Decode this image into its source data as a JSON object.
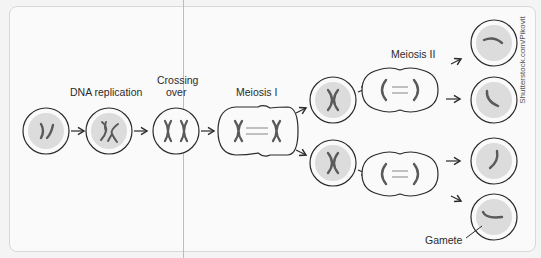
{
  "diagram": {
    "title": "Meiosis",
    "labels": {
      "dna_replication": "DNA replication",
      "crossing_over_line1": "Crossing",
      "crossing_over_line2": "over",
      "meiosis_1": "Meiosis I",
      "meiosis_2": "Meiosis II",
      "gamete": "Gamete"
    },
    "credit": "Shutterstock.com/Pikovit",
    "stages": [
      {
        "id": "initial-cell",
        "type": "cell"
      },
      {
        "id": "dna-replication-cell",
        "type": "cell"
      },
      {
        "id": "crossing-over-cell",
        "type": "cell"
      },
      {
        "id": "meiosis-1-dividing-cell",
        "type": "dividing-cell"
      },
      {
        "id": "daughter-cell-top",
        "type": "cell"
      },
      {
        "id": "daughter-cell-bottom",
        "type": "cell"
      },
      {
        "id": "meiosis-2-dividing-cell-top",
        "type": "dividing-cell"
      },
      {
        "id": "meiosis-2-dividing-cell-bottom",
        "type": "dividing-cell"
      },
      {
        "id": "gamete-1",
        "type": "cell"
      },
      {
        "id": "gamete-2",
        "type": "cell"
      },
      {
        "id": "gamete-3",
        "type": "cell"
      },
      {
        "id": "gamete-4",
        "type": "cell"
      }
    ],
    "colors": {
      "outline": "#2a2a2a",
      "cell_fill": "#dcdcdc",
      "chromosome": "#5a5a5a",
      "background": "#fafafa"
    }
  }
}
